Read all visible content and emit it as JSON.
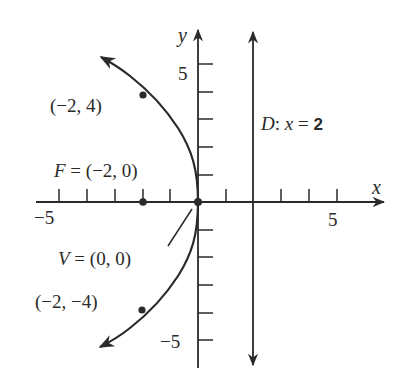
{
  "diagram": {
    "equation": "y^2 = -8x",
    "colors": {
      "ink": "#2a2a2a",
      "background": "#ffffff"
    },
    "axes": {
      "x_label": "x",
      "y_label": "y",
      "x_range": [
        -5.8,
        6.6
      ],
      "y_range": [
        -6.1,
        6.2
      ],
      "x_ticks": [
        -5,
        -4,
        -3,
        -2,
        -1,
        1,
        2,
        3,
        4,
        5
      ],
      "y_ticks": [
        -5,
        -4,
        -3,
        -2,
        -1,
        1,
        2,
        3,
        4,
        5
      ],
      "x_tick_labels": {
        "neg": "−5",
        "pos": "5"
      },
      "y_tick_labels": {
        "pos": "5",
        "neg": "−5"
      }
    },
    "labels": {
      "upper_point": "(−2, 4)",
      "lower_point": "(−2, −4)",
      "focus": "F = (−2, 0)",
      "vertex": "V = (0, 0)",
      "directrix_prefix": "D:",
      "directrix_eq": " x = 2"
    },
    "points": [
      {
        "name": "upper_point",
        "x": -2,
        "y": 4
      },
      {
        "name": "lower_point",
        "x": -2,
        "y": -4
      },
      {
        "name": "focus",
        "x": -2,
        "y": 0
      },
      {
        "name": "vertex",
        "x": 0,
        "y": 0
      }
    ],
    "directrix": {
      "x": 2
    }
  }
}
